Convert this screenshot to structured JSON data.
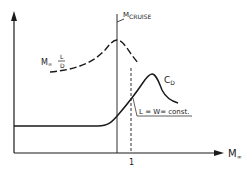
{
  "diagram": {
    "x_axis_label": "M",
    "x_axis_subscript": "∞",
    "x_tick_label": "1",
    "cruise_label_main": "M",
    "cruise_label_sub": "CRUISE",
    "ld_label_prefix": "M",
    "ld_label_sub": "∞",
    "ld_label_num": "L",
    "ld_label_den": "D",
    "cd_label_main": "C",
    "cd_label_sub": "D",
    "constraint_label": "L = W= const.",
    "ink_color": "#1a1a1a"
  }
}
